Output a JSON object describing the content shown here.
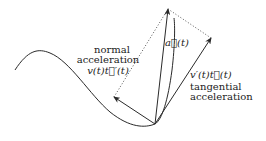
{
  "labels": {
    "normal_line1": "normal",
    "normal_line2": "acceleration",
    "normal_formula": "v(t)t⃗′(t)",
    "a_vector": "a⃗(t)",
    "tangential_formula": "v′(t)t⃗(t)",
    "tangential_line1": "tangential",
    "tangential_line2": "acceleration"
  },
  "colors": {
    "stroke": "#2a2a2a",
    "dotted": "#555555"
  }
}
